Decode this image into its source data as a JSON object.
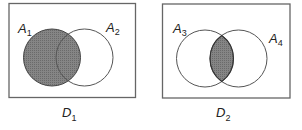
{
  "diagrams": [
    {
      "id": "D1",
      "caption": {
        "main": "D",
        "sub": "1"
      },
      "sets": [
        {
          "main": "A",
          "sub": "1"
        },
        {
          "main": "A",
          "sub": "2"
        }
      ],
      "shaded_region": "A1 (entire left circle)"
    },
    {
      "id": "D2",
      "caption": {
        "main": "D",
        "sub": "2"
      },
      "sets": [
        {
          "main": "A",
          "sub": "3"
        },
        {
          "main": "A",
          "sub": "4"
        }
      ],
      "shaded_region": "A3 ∩ A4 (intersection)"
    }
  ],
  "colors": {
    "shade": "#7d7d7d",
    "stroke": "#555555",
    "box": "#666666"
  }
}
